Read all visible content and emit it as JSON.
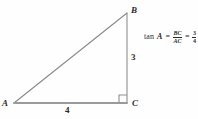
{
  "figure": {
    "type": "right-triangle-diagram",
    "vertices": [
      {
        "name": "A",
        "label": "A",
        "x": 14,
        "y": 103,
        "angle_marked": false
      },
      {
        "name": "B",
        "label": "B",
        "x": 127,
        "y": 13,
        "angle_marked": false
      },
      {
        "name": "C",
        "label": "C",
        "x": 127,
        "y": 103,
        "angle_marked": true
      }
    ],
    "sides": [
      {
        "name": "leg-vertical",
        "from": "B",
        "to": "C",
        "label": "3"
      },
      {
        "name": "leg-horizontal",
        "from": "A",
        "to": "C",
        "label": "4"
      },
      {
        "name": "hypotenuse",
        "from": "A",
        "to": "B",
        "label": ""
      }
    ],
    "right_angle_at": "C",
    "colors": {
      "background": "#fefefe",
      "leg_horizontal": "#9a9a9a",
      "leg_vertical": "#8f8f8f",
      "hypotenuse": "#8a8a8a",
      "right_angle_marker": "#8f8f8f",
      "text": "#2b2b2b"
    }
  },
  "formula": {
    "function_name": "tan",
    "angle": "A",
    "equals_1": "=",
    "ratio": {
      "numerator": "BC",
      "denominator": "AC"
    },
    "equals_2": "=",
    "value": {
      "numerator": "3",
      "denominator": "4"
    }
  }
}
